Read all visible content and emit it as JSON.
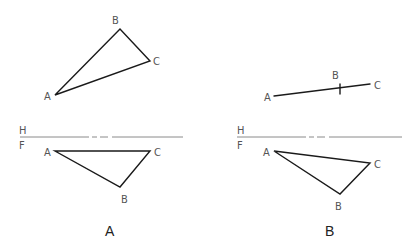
{
  "diagram": {
    "panels": [
      {
        "caption": "A",
        "top_view": {
          "points": {
            "A": [
              55,
              95
            ],
            "B": [
              120,
              29
            ],
            "C": [
              150,
              61
            ]
          },
          "labels": {
            "A": "A",
            "B": "B",
            "C": "C"
          }
        },
        "reference_line": {
          "upper": "H",
          "lower": "F"
        },
        "front_view": {
          "points": {
            "A": [
              55,
              151
            ],
            "B": [
              120,
              187
            ],
            "C": [
              150,
              151
            ]
          },
          "labels": {
            "A": "A",
            "B": "B",
            "C": "C"
          }
        }
      },
      {
        "caption": "B",
        "top_view": {
          "points": {
            "A": [
              274,
              96
            ],
            "B": [
              340,
              89
            ],
            "C": [
              370,
              84
            ]
          },
          "labels": {
            "A": "A",
            "B": "B",
            "C": "C"
          }
        },
        "reference_line": {
          "upper": "H",
          "lower": "F"
        },
        "front_view": {
          "points": {
            "A": [
              274,
              151
            ],
            "B": [
              340,
              194
            ],
            "C": [
              370,
              163
            ]
          },
          "labels": {
            "A": "A",
            "B": "B",
            "C": "C"
          }
        }
      }
    ]
  }
}
